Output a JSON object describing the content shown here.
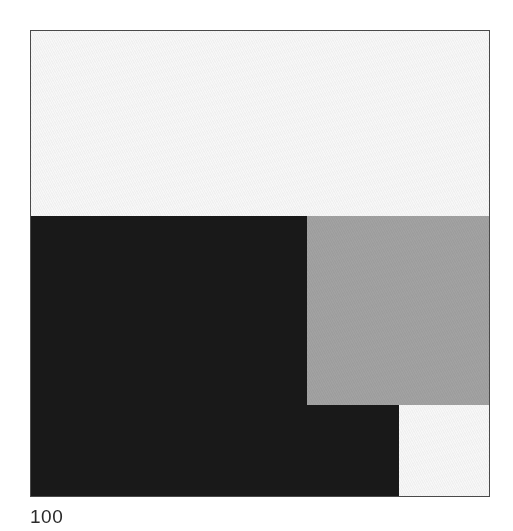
{
  "figure": {
    "caption": "100",
    "frame": {
      "x": 30,
      "y": 30,
      "width": 460,
      "height": 467,
      "border_color": "#4a4a4a",
      "background_color": "#f7f7f7"
    },
    "palette": {
      "white": "#f7f7f7",
      "gray": "#a2a2a2",
      "black": "#191919",
      "frame_border": "#4a4a4a",
      "caption_text": "#2b2b2b",
      "page_background": "#ffffff"
    }
  },
  "chart_data": {
    "type": "heatmap",
    "title": "",
    "subtitle": "",
    "xlabel": "",
    "ylabel": "",
    "annotations": [
      "100"
    ],
    "legend": [],
    "grid": false,
    "x": [
      0,
      100
    ],
    "y": [
      0,
      100
    ],
    "xlim": [
      0,
      100
    ],
    "ylim": [
      0,
      100
    ],
    "value_levels": [
      {
        "name": "white",
        "value": 0,
        "color": "#f7f7f7"
      },
      {
        "name": "gray",
        "value": 1,
        "color": "#a2a2a2"
      },
      {
        "name": "black",
        "value": 2,
        "color": "#191919"
      }
    ],
    "blocks": [
      {
        "name": "top-white-band",
        "level": "white",
        "color": "#f7f7f7",
        "x_pct": 0.0,
        "y_pct": 0.0,
        "w_pct": 100.0,
        "h_pct": 39.8
      },
      {
        "name": "left-black-block",
        "level": "black",
        "color": "#191919",
        "x_pct": 0.0,
        "y_pct": 39.8,
        "w_pct": 60.2,
        "h_pct": 60.2
      },
      {
        "name": "right-gray-block",
        "level": "gray",
        "color": "#a2a2a2",
        "x_pct": 60.2,
        "y_pct": 39.8,
        "w_pct": 39.8,
        "h_pct": 40.7
      },
      {
        "name": "lower-middle-black-block",
        "level": "black",
        "color": "#191919",
        "x_pct": 60.2,
        "y_pct": 80.5,
        "w_pct": 20.2,
        "h_pct": 19.5
      },
      {
        "name": "bottom-right-white-block",
        "level": "white",
        "color": "#f7f7f7",
        "x_pct": 80.4,
        "y_pct": 80.5,
        "w_pct": 19.6,
        "h_pct": 19.5
      }
    ]
  }
}
